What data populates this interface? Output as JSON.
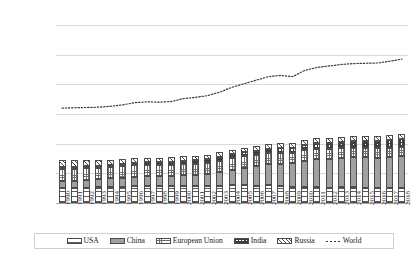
{
  "chart_data": {
    "type": "bar",
    "subtype": "stacked-bar-with-line-overlay",
    "title": "",
    "subtitle": "",
    "xlabel": "",
    "ylabel": "",
    "ylim": [
      0,
      60000
    ],
    "ytick_labels": [
      "60,000.00",
      "50,000.00",
      "40,000.00",
      "30,000.00",
      "20,000.00",
      "10,000.00",
      "-"
    ],
    "ytick_values": [
      60000,
      50000,
      40000,
      30000,
      20000,
      10000,
      0
    ],
    "grid": true,
    "legend_position": "bottom",
    "categories": [
      "1990",
      "1991",
      "1992",
      "1993",
      "1994",
      "1995",
      "1996",
      "1997",
      "1998",
      "1999",
      "2000",
      "2001",
      "2002",
      "2003",
      "2004",
      "2005",
      "2006",
      "2007",
      "2008",
      "2009",
      "2010",
      "2011",
      "2012",
      "2013",
      "2014",
      "2015",
      "2016",
      "2017",
      "2018"
    ],
    "series": [
      {
        "name": "USA",
        "fill": "horizontal-lines",
        "stacked": true,
        "values": [
          5120,
          5070,
          5180,
          5280,
          5360,
          5400,
          5570,
          5650,
          5660,
          5720,
          5870,
          5760,
          5790,
          5830,
          5920,
          5930,
          5850,
          5930,
          5720,
          5310,
          5460,
          5320,
          5100,
          5230,
          5280,
          5180,
          5110,
          5070,
          5200
        ]
      },
      {
        "name": "China",
        "fill": "solid-grey",
        "stacked": true,
        "values": [
          2260,
          2400,
          2550,
          2800,
          2950,
          3150,
          3300,
          3350,
          3320,
          3380,
          3460,
          3600,
          3870,
          4510,
          5290,
          5930,
          6550,
          7100,
          7470,
          8060,
          8630,
          9500,
          9780,
          10100,
          10250,
          10200,
          10200,
          10350,
          10520
        ]
      },
      {
        "name": "European Union",
        "fill": "checker",
        "stacked": true,
        "values": [
          4100,
          4030,
          3940,
          3860,
          3830,
          3870,
          3950,
          3890,
          3900,
          3850,
          3870,
          3930,
          3930,
          3990,
          3980,
          3960,
          3950,
          3880,
          3830,
          3540,
          3620,
          3480,
          3410,
          3320,
          3180,
          3220,
          3220,
          3240,
          3150
        ]
      },
      {
        "name": "India",
        "fill": "dense-dots",
        "stacked": true,
        "values": [
          580,
          620,
          660,
          690,
          730,
          790,
          840,
          890,
          930,
          1000,
          1050,
          1070,
          1110,
          1140,
          1200,
          1260,
          1340,
          1440,
          1550,
          1690,
          1760,
          1880,
          2010,
          2070,
          2240,
          2290,
          2370,
          2450,
          2620
        ]
      },
      {
        "name": "Russia",
        "fill": "diagonal-hatch",
        "stacked": true,
        "values": [
          2400,
          2320,
          2090,
          1900,
          1730,
          1680,
          1610,
          1530,
          1520,
          1540,
          1550,
          1560,
          1540,
          1570,
          1580,
          1590,
          1620,
          1610,
          1640,
          1540,
          1620,
          1680,
          1700,
          1690,
          1680,
          1650,
          1680,
          1700,
          1750
        ]
      },
      {
        "name": "World",
        "fill": "dotted-line",
        "type": "line",
        "stacked": false,
        "values": [
          32000,
          32100,
          32200,
          32300,
          32600,
          33100,
          33800,
          34100,
          34000,
          34200,
          35200,
          35600,
          36200,
          37400,
          39000,
          40200,
          41400,
          42600,
          43000,
          42600,
          44700,
          45700,
          46200,
          46700,
          47000,
          47100,
          47200,
          47800,
          48500
        ]
      }
    ],
    "legend": [
      {
        "label": "USA",
        "fill": "horizontal-lines"
      },
      {
        "label": "China",
        "fill": "solid-grey"
      },
      {
        "label": "European Union",
        "fill": "checker"
      },
      {
        "label": "India",
        "fill": "dense-dots"
      },
      {
        "label": "Russia",
        "fill": "diagonal-hatch"
      },
      {
        "label": "World",
        "fill": "dotted-line"
      }
    ],
    "colors": {
      "grid": "#d9d9d9",
      "axis": "#a6a6a6",
      "china_fill": "#a0a0a0",
      "text": "#2b2b2b"
    }
  }
}
